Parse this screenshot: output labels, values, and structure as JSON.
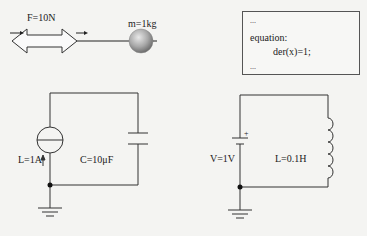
{
  "mechanical": {
    "force_label": "F=10N",
    "mass_label": "m=1kg"
  },
  "code_box": {
    "line1": "...",
    "line2": "equation:",
    "line3": "der(x)=1;",
    "line4": "..."
  },
  "circuit_left": {
    "source_label": "L=1A",
    "capacitor_label": "C=10μF"
  },
  "circuit_right": {
    "source_label": "V=1V",
    "inductor_label": "L=0.1H",
    "plus_sign": "+"
  }
}
